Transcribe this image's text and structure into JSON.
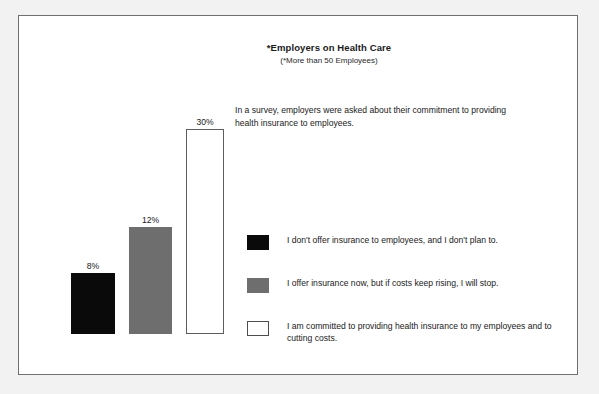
{
  "chart_data": {
    "type": "bar",
    "title": "*Employers on Health Care",
    "subtitle": "(*More than 50 Employees)",
    "description": "In a survey, employers were asked about their commitment to providing health insurance to employees.",
    "xlabel": "",
    "ylabel": "",
    "grid": false,
    "legend_position": "right",
    "categories": [
      "I don't offer insurance to employees, and I don't plan to.",
      "I offer insurance now, but if costs keep rising, I will stop.",
      "I am committed to providing health insurance to my employees and to cutting costs."
    ],
    "values": [
      8,
      12,
      30
    ],
    "value_labels": [
      "8%",
      "12%",
      "30%"
    ],
    "series": [
      {
        "name": "Employer commitment to health insurance",
        "values": [
          8,
          12,
          30
        ]
      }
    ],
    "bars": [
      {
        "label": "8%",
        "value": 8,
        "fill": "fill-black",
        "swatch_name": "black",
        "left": 52,
        "width": 44,
        "height": 61
      },
      {
        "label": "12%",
        "value": 12,
        "fill": "fill-gray",
        "swatch_name": "gray",
        "left": 110,
        "width": 43,
        "height": 107
      },
      {
        "label": "30%",
        "value": 30,
        "fill": "fill-white",
        "swatch_name": "white-outlined",
        "left": 167,
        "width": 38,
        "height": 205
      }
    ],
    "colors": {
      "black": "#0a0a0a",
      "gray": "#6e6e6e",
      "white": "#ffffff",
      "frame_border": "#6f6f6f",
      "text": "#1a1a1a",
      "page_background": "#f2f2f2",
      "plot_background": "#ffffff"
    }
  },
  "legend": {
    "items": [
      {
        "swatch": "fill-black",
        "text": "I don't offer insurance to employees, and I don't plan to."
      },
      {
        "swatch": "fill-gray",
        "text": "I offer insurance now, but if costs keep rising, I will stop."
      },
      {
        "swatch": "fill-white",
        "text": "I am committed to providing health insurance to my employees and to cutting costs."
      }
    ]
  }
}
